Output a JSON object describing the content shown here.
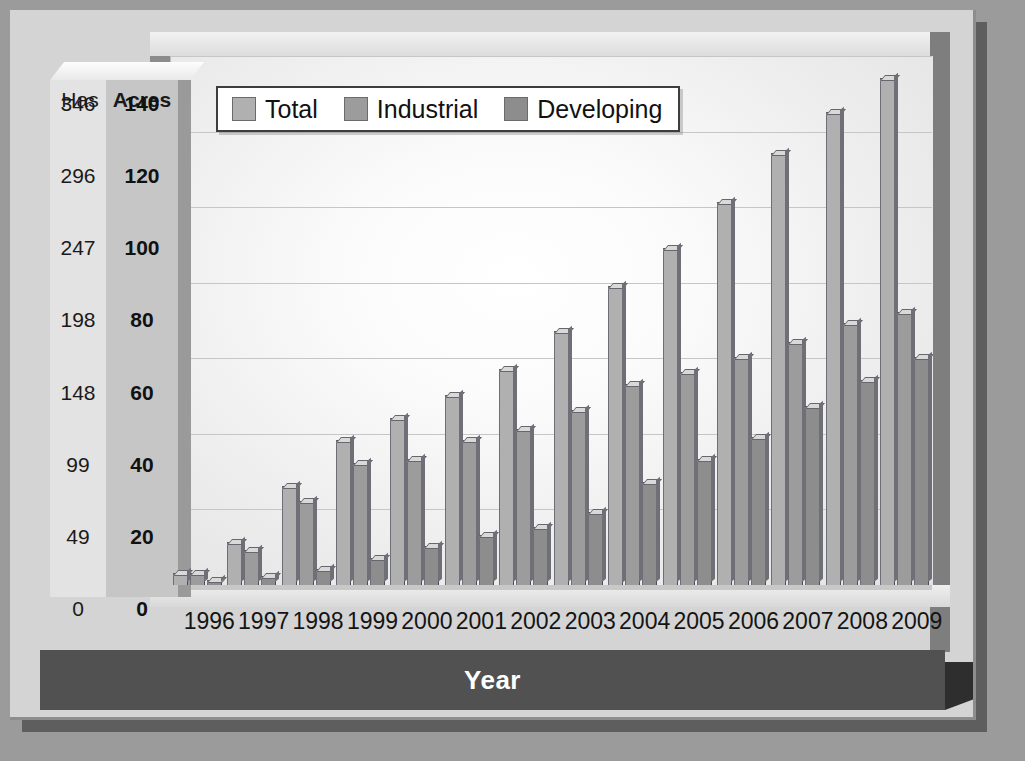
{
  "chart_data": {
    "type": "bar",
    "title": "",
    "xlabel": "Year",
    "ylabel": "Acres",
    "ylabel_secondary": "Has",
    "ylim": [
      0,
      140
    ],
    "grid": true,
    "legend_position": "top-left",
    "categories": [
      "1996",
      "1997",
      "1998",
      "1999",
      "2000",
      "2001",
      "2002",
      "2003",
      "2004",
      "2005",
      "2006",
      "2007",
      "2008",
      "2009"
    ],
    "series": [
      {
        "name": "Total",
        "color": "#b0b0b0",
        "values": [
          3,
          11,
          26,
          38,
          44,
          50,
          57,
          67,
          79,
          89,
          101,
          114,
          125,
          134
        ]
      },
      {
        "name": "Industrial",
        "color": "#9c9c9c",
        "values": [
          3,
          9,
          22,
          32,
          33,
          38,
          41,
          46,
          53,
          56,
          60,
          64,
          69,
          72
        ]
      },
      {
        "name": "Developing",
        "color": "#8d8d8d",
        "values": [
          1,
          2,
          4,
          7,
          10,
          13,
          15,
          19,
          27,
          33,
          39,
          47,
          54,
          60
        ]
      }
    ],
    "y_axis_primary": {
      "header": "Acres",
      "ticks": [
        140,
        120,
        100,
        80,
        60,
        40,
        20,
        0
      ]
    },
    "y_axis_secondary": {
      "header": "Has",
      "ticks": [
        346,
        296,
        247,
        198,
        148,
        99,
        49,
        0
      ]
    }
  },
  "colors": {
    "background": "#9b9b9b",
    "panel": "#d4d4d4",
    "plot_area": "#f4f4f4",
    "axis_band": "#c6c6c6",
    "title_band": "#515151",
    "title_text": "#ffffff",
    "gridline": "#c6c6c6"
  }
}
